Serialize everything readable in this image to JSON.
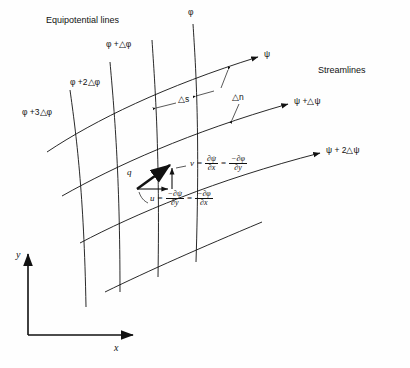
{
  "figure": {
    "title_left": "Equipotential lines",
    "title_right": "Streamlines",
    "width": 410,
    "height": 368,
    "background": "#fefefe",
    "line_color": "#111111"
  },
  "equipotential_labels": [
    {
      "id": "phi0",
      "text": "φ"
    },
    {
      "id": "phi1",
      "text": "φ +△φ"
    },
    {
      "id": "phi2",
      "text": "φ +2△φ"
    },
    {
      "id": "phi3",
      "text": "φ +3△φ"
    }
  ],
  "streamline_labels": [
    {
      "id": "psi0",
      "text": "ψ"
    },
    {
      "id": "psi1",
      "text": "ψ +△ψ"
    },
    {
      "id": "psi2",
      "text": "ψ + 2△ψ"
    }
  ],
  "spacing": {
    "along_stream": "△s",
    "normal": "△n"
  },
  "vector": {
    "magnitude_label": "q",
    "u_label": "u",
    "v_label": "v"
  },
  "equations": {
    "v": {
      "lhs": "v",
      "eq1": "=",
      "term1_num": "∂ψ",
      "term1_den": "∂x",
      "eq2": "=",
      "term2_num": "−∂φ",
      "term2_den": "∂y"
    },
    "u": {
      "lhs": "u",
      "eq1": "=",
      "term1_num": "−∂ψ",
      "term1_den": "∂y",
      "eq2": "=",
      "term2_num": "−∂φ",
      "term2_den": "∂x"
    }
  },
  "axes": {
    "x_label": "x",
    "y_label": "y"
  }
}
